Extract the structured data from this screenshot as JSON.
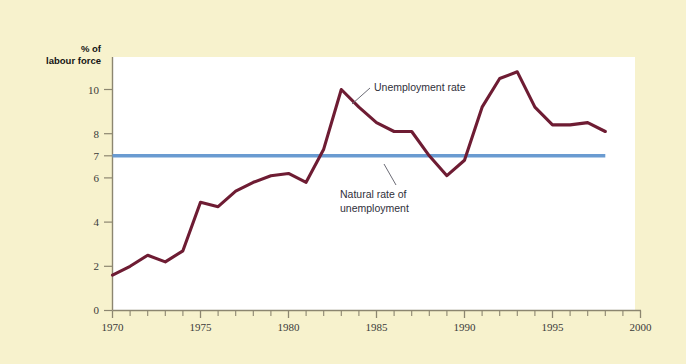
{
  "figure": {
    "background_color": "#f7f2cd",
    "plot_background_color": "#ffffff",
    "axis_color": "#8c8670"
  },
  "axis": {
    "y_title_line1": "% of",
    "y_title_line2": "labour force",
    "y_ticks": [
      "0",
      "2",
      "4",
      "6",
      "7",
      "8",
      "10"
    ],
    "x_ticks": [
      "1970",
      "1975",
      "1980",
      "1985",
      "1990",
      "1995",
      "2000"
    ]
  },
  "annotations": {
    "unemployment_rate": "Unemployment rate",
    "natural_rate_line1": "Natural rate of",
    "natural_rate_line2": "unemployment"
  },
  "chart_data": {
    "type": "line",
    "title": "",
    "xlabel": "",
    "ylabel": "% of labour force",
    "xlim": [
      1970,
      2000
    ],
    "ylim": [
      0,
      11.5
    ],
    "grid": false,
    "legend": "annotations",
    "x_tick_values": [
      1970,
      1975,
      1980,
      1985,
      1990,
      1995,
      2000
    ],
    "x_minor_tick_step": 1,
    "y_tick_values": [
      0,
      2,
      4,
      6,
      7,
      8,
      10
    ],
    "series": [
      {
        "name": "Unemployment rate",
        "color": "#6e1c33",
        "x": [
          1970,
          1971,
          1972,
          1973,
          1974,
          1975,
          1976,
          1977,
          1978,
          1979,
          1980,
          1981,
          1982,
          1983,
          1984,
          1985,
          1986,
          1987,
          1988,
          1989,
          1990,
          1991,
          1992,
          1993,
          1994,
          1995,
          1996,
          1997,
          1998
        ],
        "values": [
          1.6,
          2.0,
          2.5,
          2.2,
          2.7,
          4.9,
          4.7,
          5.4,
          5.8,
          6.1,
          6.2,
          5.8,
          7.3,
          10.0,
          9.2,
          8.5,
          8.1,
          8.1,
          7.0,
          6.1,
          6.8,
          9.2,
          10.5,
          10.8,
          9.2,
          8.4,
          8.4,
          8.5,
          8.1
        ]
      },
      {
        "name": "Natural rate of unemployment",
        "color": "#6a9bd1",
        "x": [
          1970,
          1998
        ],
        "values": [
          7.0,
          7.0
        ],
        "constant": 7.0
      }
    ]
  }
}
